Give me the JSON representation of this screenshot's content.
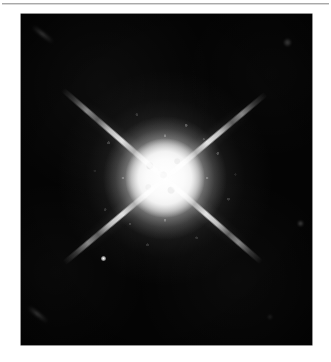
{
  "page": {
    "background_color": "#ffffff",
    "width": 331,
    "height": 362
  },
  "top_rule": {
    "color": "#9a9a9a",
    "label": ""
  },
  "figure": {
    "panel": {
      "label": "",
      "background_color": "#040404",
      "left": 21,
      "top": 14,
      "width": 291,
      "height": 331,
      "caption": ""
    },
    "star": {
      "name": "central-star",
      "center_x": 165,
      "center_y": 178,
      "core_color": "#ffffff",
      "halo_color": "#b4b4b4",
      "core_diameter_px": 80,
      "halo_diameter_px": 216,
      "description": ""
    },
    "diffraction_spikes": [
      {
        "name": "spike-upper-right",
        "angle_deg": -40,
        "length_px": 132
      },
      {
        "name": "spike-upper-left",
        "angle_deg": -139,
        "length_px": 136
      },
      {
        "name": "spike-lower-right",
        "angle_deg": 41,
        "length_px": 128
      },
      {
        "name": "spike-lower-left",
        "angle_deg": 140,
        "length_px": 132
      }
    ],
    "point_sources": [
      {
        "name": "companion-point-source",
        "x": 103,
        "y": 258,
        "size_px": 5
      }
    ],
    "artifacts": [
      {
        "name": "artifact-top-left-streak",
        "x": 30,
        "y": 34,
        "width": 24,
        "height": 3,
        "angle_deg": 38
      },
      {
        "name": "artifact-top-right-spot",
        "x": 286,
        "y": 41,
        "width": 8,
        "height": 8
      },
      {
        "name": "artifact-bottom-left-streak",
        "x": 26,
        "y": 314,
        "width": 22,
        "height": 3,
        "angle_deg": 38
      },
      {
        "name": "artifact-right-edge-spot",
        "x": 300,
        "y": 222,
        "width": 6,
        "height": 6
      }
    ]
  },
  "chart_data": {
    "type": "heatmap",
    "title": "",
    "xlabel": "",
    "ylabel": "",
    "colormap": "grayscale",
    "value_range": [
      0,
      255
    ],
    "background_level": 4,
    "peak_level": 255,
    "image_extent_px": {
      "x": 291,
      "y": 331
    },
    "features": [
      {
        "feature": "core",
        "center": [
          165,
          178
        ],
        "radius_px": 40,
        "peak_intensity": 255
      },
      {
        "feature": "inner-halo",
        "center": [
          165,
          178
        ],
        "radius_px": 62,
        "peak_intensity": 200
      },
      {
        "feature": "speckled-halo",
        "center": [
          165,
          178
        ],
        "radius_px": 88,
        "peak_intensity": 120
      },
      {
        "feature": "outer-glow",
        "center": [
          165,
          178
        ],
        "radius_px": 108,
        "peak_intensity": 60
      },
      {
        "feature": "spike-upper-left",
        "angle_deg": -139,
        "length_px": 136,
        "peak_intensity": 210
      },
      {
        "feature": "spike-upper-right",
        "angle_deg": -40,
        "length_px": 132,
        "peak_intensity": 215
      },
      {
        "feature": "spike-lower-left",
        "angle_deg": 140,
        "length_px": 132,
        "peak_intensity": 190
      },
      {
        "feature": "spike-lower-right",
        "angle_deg": 41,
        "length_px": 128,
        "peak_intensity": 195
      },
      {
        "feature": "companion-point",
        "center": [
          103,
          258
        ],
        "radius_px": 3,
        "peak_intensity": 230
      }
    ]
  }
}
